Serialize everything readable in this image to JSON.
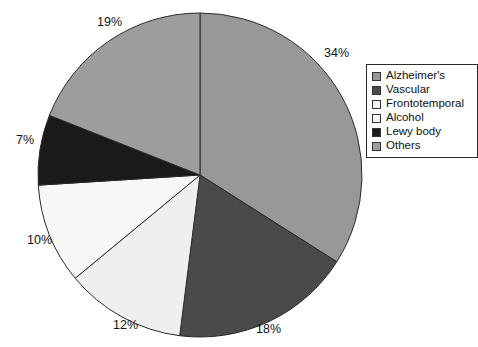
{
  "chart_data": {
    "type": "pie",
    "title": "",
    "subtitle": "",
    "xlabel": "",
    "ylabel": "",
    "legend_position": "top-right",
    "grid": false,
    "start_angle_deg": 0,
    "direction": "clockwise",
    "categories": [
      "Alzheimer's",
      "Vascular",
      "Frontotemporal",
      "Alcohol",
      "Lewy body",
      "Others"
    ],
    "values": [
      34,
      18,
      12,
      10,
      7,
      19
    ],
    "value_unit": "%",
    "data_labels": [
      "34%",
      "18%",
      "12%",
      "10%",
      "7%",
      "19%"
    ],
    "colors": [
      "#989898",
      "#4a4a4a",
      "#efefef",
      "#f7f7f7",
      "#1a1a1a",
      "#9d9d9d"
    ],
    "slice_border_color": "#2b2b2b"
  },
  "labels": {
    "alzheimers": "34%",
    "vascular": "18%",
    "frontotemporal": "12%",
    "alcohol": "10%",
    "lewy_body": "7%",
    "others": "19%"
  },
  "legend": {
    "items": [
      {
        "label": "Alzheimer's",
        "color": "#989898"
      },
      {
        "label": "Vascular",
        "color": "#4a4a4a"
      },
      {
        "label": "Frontotemporal",
        "color": "#efefef"
      },
      {
        "label": "Alcohol",
        "color": "#f7f7f7"
      },
      {
        "label": "Lewy body",
        "color": "#1a1a1a"
      },
      {
        "label": "Others",
        "color": "#9d9d9d"
      }
    ]
  }
}
